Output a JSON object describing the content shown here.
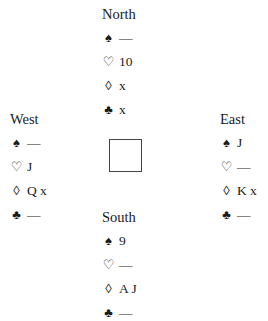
{
  "diagram": {
    "type": "bridge-deal",
    "suit_symbols": {
      "spades": "♠",
      "hearts": "♡",
      "diamonds": "◊",
      "clubs": "♣"
    },
    "hands": {
      "north": {
        "label": "North",
        "spades": "—",
        "hearts": "10",
        "diamonds": "x",
        "clubs": "x"
      },
      "west": {
        "label": "West",
        "spades": "—",
        "hearts": "J",
        "diamonds": "Q x",
        "clubs": "—"
      },
      "east": {
        "label": "East",
        "spades": "J",
        "hearts": "—",
        "diamonds": "K x",
        "clubs": "—"
      },
      "south": {
        "label": "South",
        "spades": "9",
        "hearts": "—",
        "diamonds": "A J",
        "clubs": "—"
      }
    }
  }
}
